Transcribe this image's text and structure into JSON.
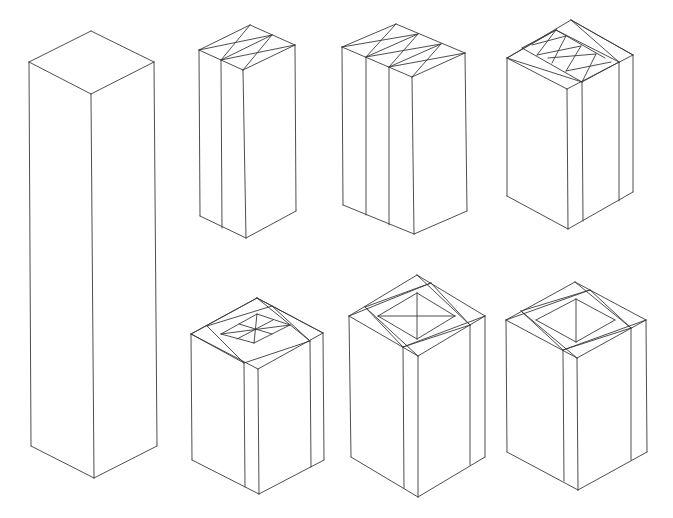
{
  "figure": {
    "stroke_color": "#3a3a3a",
    "background": "#ffffff"
  },
  "boxes": [
    {
      "id": "box-tall",
      "label": "Tall plain prism",
      "top": [
        91,
        31
      ],
      "left": [
        29,
        62
      ],
      "right": [
        154,
        62
      ],
      "front": [
        91,
        94
      ],
      "bleft": [
        31,
        446
      ],
      "bright": [
        157,
        446
      ],
      "bfront": [
        94,
        478
      ],
      "verticals": [],
      "toplines": []
    },
    {
      "id": "box-two-strip",
      "label": "Prism split into two strips",
      "top": [
        250,
        25
      ],
      "left": [
        199,
        50
      ],
      "right": [
        295,
        45
      ],
      "front": [
        243,
        70
      ],
      "bleft": [
        200,
        216
      ],
      "bright": [
        296,
        211
      ],
      "bfront": [
        246,
        238
      ],
      "verticals": [
        [
          [
            221,
            60
          ],
          [
            222,
            228
          ]
        ]
      ],
      "toplines": [
        [
          [
            199,
            50
          ],
          [
            272,
            35
          ]
        ],
        [
          [
            221,
            60
          ],
          [
            295,
            45
          ]
        ],
        [
          [
            250,
            25
          ],
          [
            221,
            60
          ]
        ],
        [
          [
            272,
            35
          ],
          [
            243,
            70
          ]
        ],
        [
          [
            272,
            35
          ],
          [
            221,
            60
          ]
        ]
      ]
    },
    {
      "id": "box-three-strip",
      "label": "Prism split into three strips",
      "top": [
        396,
        24
      ],
      "left": [
        342,
        47
      ],
      "right": [
        465,
        53
      ],
      "front": [
        412,
        77
      ],
      "bleft": [
        343,
        205
      ],
      "bright": [
        467,
        211
      ],
      "bfront": [
        414,
        234
      ],
      "verticals": [
        [
          [
            366,
            57
          ],
          [
            366,
            215
          ]
        ],
        [
          [
            389,
            67
          ],
          [
            389,
            225
          ]
        ]
      ],
      "toplines": [
        [
          [
            342,
            47
          ],
          [
            418,
            34
          ]
        ],
        [
          [
            366,
            57
          ],
          [
            441,
            44
          ]
        ],
        [
          [
            389,
            67
          ],
          [
            465,
            53
          ]
        ],
        [
          [
            396,
            24
          ],
          [
            366,
            57
          ]
        ],
        [
          [
            418,
            34
          ],
          [
            389,
            67
          ]
        ],
        [
          [
            441,
            44
          ],
          [
            412,
            77
          ]
        ],
        [
          [
            418,
            34
          ],
          [
            366,
            57
          ]
        ],
        [
          [
            441,
            44
          ],
          [
            389,
            67
          ]
        ]
      ]
    },
    {
      "id": "box-frame-three",
      "label": "Prism with frame and three-cell inner top",
      "top": [
        571,
        20
      ],
      "left": [
        507,
        58
      ],
      "right": [
        633,
        55
      ],
      "front": [
        567,
        89
      ],
      "bleft": [
        507,
        196
      ],
      "bright": [
        633,
        192
      ],
      "bfront": [
        568,
        229
      ],
      "verticals": [
        [
          [
            582,
            82
          ],
          [
            583,
            221
          ]
        ],
        [
          [
            619,
            62
          ],
          [
            619,
            201
          ]
        ]
      ],
      "toplines": [
        [
          [
            556,
            30
          ],
          [
            619,
            62
          ]
        ],
        [
          [
            522,
            48
          ],
          [
            582,
            82
          ]
        ],
        [
          [
            556,
            30
          ],
          [
            522,
            48
          ]
        ],
        [
          [
            619,
            62
          ],
          [
            582,
            82
          ]
        ],
        [
          [
            507,
            58
          ],
          [
            556,
            30
          ]
        ],
        [
          [
            571,
            20
          ],
          [
            633,
            55
          ]
        ],
        [
          [
            571,
            20
          ],
          [
            619,
            62
          ]
        ],
        [
          [
            507,
            58
          ],
          [
            582,
            82
          ]
        ],
        [
          [
            556,
            30
          ],
          [
            537,
            55
          ]
        ],
        [
          [
            532,
            45
          ],
          [
            566,
            36
          ]
        ],
        [
          [
            537,
            55
          ],
          [
            581,
            46
          ]
        ],
        [
          [
            566,
            36
          ],
          [
            552,
            63
          ]
        ],
        [
          [
            548,
            58
          ],
          [
            596,
            54
          ]
        ],
        [
          [
            581,
            46
          ],
          [
            566,
            71
          ]
        ],
        [
          [
            566,
            71
          ],
          [
            611,
            62
          ]
        ],
        [
          [
            596,
            54
          ],
          [
            582,
            82
          ]
        ],
        [
          [
            556,
            30
          ],
          [
            605,
            58
          ]
        ]
      ]
    },
    {
      "id": "box-frame-four",
      "label": "Prism with frame and four-cell inner top",
      "top": [
        257,
        298
      ],
      "left": [
        191,
        334
      ],
      "right": [
        323,
        333
      ],
      "front": [
        258,
        369
      ],
      "bleft": [
        192,
        460
      ],
      "bright": [
        324,
        460
      ],
      "bfront": [
        259,
        494
      ],
      "verticals": [
        [
          [
            244,
            363
          ],
          [
            245,
            487
          ]
        ],
        [
          [
            310,
            341
          ],
          [
            311,
            467
          ]
        ]
      ],
      "toplines": [
        [
          [
            207,
            326
          ],
          [
            244,
            363
          ]
        ],
        [
          [
            272,
            306
          ],
          [
            310,
            341
          ]
        ],
        [
          [
            207,
            326
          ],
          [
            272,
            306
          ]
        ],
        [
          [
            244,
            363
          ],
          [
            310,
            341
          ]
        ],
        [
          [
            257,
            298
          ],
          [
            323,
            333
          ]
        ],
        [
          [
            191,
            334
          ],
          [
            257,
            298
          ]
        ],
        [
          [
            191,
            334
          ],
          [
            244,
            363
          ]
        ],
        [
          [
            257,
            298
          ],
          [
            310,
            341
          ]
        ],
        [
          [
            221,
            334
          ],
          [
            257,
            314
          ]
        ],
        [
          [
            257,
            314
          ],
          [
            290,
            325
          ]
        ],
        [
          [
            290,
            325
          ],
          [
            254,
            343
          ]
        ],
        [
          [
            254,
            343
          ],
          [
            221,
            334
          ]
        ],
        [
          [
            221,
            334
          ],
          [
            290,
            325
          ]
        ],
        [
          [
            257,
            314
          ],
          [
            254,
            343
          ]
        ],
        [
          [
            239,
            324
          ],
          [
            272,
            334
          ]
        ],
        [
          [
            273,
            320
          ],
          [
            237,
            339
          ]
        ]
      ]
    },
    {
      "id": "box-frame-pyramid",
      "label": "Prism with frame and pyramidal inner top",
      "top": [
        417,
        275
      ],
      "left": [
        349,
        316
      ],
      "right": [
        485,
        316
      ],
      "front": [
        418,
        356
      ],
      "bleft": [
        351,
        457
      ],
      "bright": [
        485,
        457
      ],
      "bfront": [
        418,
        497
      ],
      "verticals": [
        [
          [
            403,
            347
          ],
          [
            404,
            488
          ]
        ],
        [
          [
            470,
            325
          ],
          [
            470,
            465
          ]
        ]
      ],
      "toplines": [
        [
          [
            365,
            307
          ],
          [
            403,
            347
          ]
        ],
        [
          [
            431,
            283
          ],
          [
            470,
            325
          ]
        ],
        [
          [
            365,
            307
          ],
          [
            431,
            283
          ]
        ],
        [
          [
            403,
            347
          ],
          [
            470,
            325
          ]
        ],
        [
          [
            349,
            316
          ],
          [
            431,
            283
          ]
        ],
        [
          [
            417,
            275
          ],
          [
            470,
            325
          ]
        ],
        [
          [
            365,
            307
          ],
          [
            418,
            356
          ]
        ],
        [
          [
            403,
            347
          ],
          [
            485,
            316
          ]
        ],
        [
          [
            378,
            316
          ],
          [
            417,
            293
          ]
        ],
        [
          [
            417,
            293
          ],
          [
            455,
            316
          ]
        ],
        [
          [
            455,
            316
          ],
          [
            417,
            339
          ]
        ],
        [
          [
            417,
            339
          ],
          [
            378,
            316
          ]
        ],
        [
          [
            378,
            316
          ],
          [
            455,
            316
          ]
        ],
        [
          [
            417,
            293
          ],
          [
            417,
            339
          ]
        ]
      ]
    },
    {
      "id": "box-frame-open",
      "label": "Prism with frame and open hollow top",
      "top": [
        575,
        282
      ],
      "left": [
        506,
        320
      ],
      "right": [
        646,
        320
      ],
      "front": [
        577,
        358
      ],
      "bleft": [
        507,
        452
      ],
      "bright": [
        647,
        452
      ],
      "bfront": [
        578,
        490
      ],
      "verticals": [
        [
          [
            563,
            350
          ],
          [
            564,
            481
          ]
        ],
        [
          [
            631,
            328
          ],
          [
            631,
            460
          ]
        ]
      ],
      "toplines": [
        [
          [
            521,
            311
          ],
          [
            563,
            350
          ]
        ],
        [
          [
            590,
            290
          ],
          [
            631,
            328
          ]
        ],
        [
          [
            521,
            311
          ],
          [
            590,
            290
          ]
        ],
        [
          [
            563,
            350
          ],
          [
            631,
            328
          ]
        ],
        [
          [
            506,
            320
          ],
          [
            590,
            290
          ]
        ],
        [
          [
            575,
            282
          ],
          [
            631,
            328
          ]
        ],
        [
          [
            521,
            311
          ],
          [
            577,
            358
          ]
        ],
        [
          [
            563,
            350
          ],
          [
            646,
            320
          ]
        ],
        [
          [
            536,
            320
          ],
          [
            576,
            299
          ]
        ],
        [
          [
            576,
            299
          ],
          [
            615,
            320
          ]
        ],
        [
          [
            615,
            320
          ],
          [
            576,
            342
          ]
        ],
        [
          [
            576,
            342
          ],
          [
            536,
            320
          ]
        ],
        [
          [
            576,
            299
          ],
          [
            576,
            342
          ]
        ]
      ]
    }
  ]
}
